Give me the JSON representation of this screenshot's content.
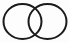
{
  "figure": {
    "name": "two-overlapping-circles",
    "canvas": {
      "width": 70,
      "height": 43,
      "background_color": "#fdfdfd"
    },
    "style": {
      "stroke_color": "#1a1a1a",
      "stroke_width": 2,
      "fill": "none"
    },
    "shapes": [
      {
        "name": "left-circle",
        "type": "ellipse",
        "cx": 22.5,
        "cy": 21.5,
        "rx": 19,
        "ry": 17.5
      },
      {
        "name": "right-circle",
        "type": "ellipse",
        "cx": 47.5,
        "cy": 21.5,
        "rx": 19,
        "ry": 17.5
      }
    ],
    "intersection": {
      "name": "lens-region",
      "top_crossing_x": 35,
      "top_crossing_y": 5,
      "bottom_crossing_x": 35,
      "bottom_crossing_y": 38,
      "left_arc_x": 28.5,
      "right_arc_x": 41.5
    }
  }
}
